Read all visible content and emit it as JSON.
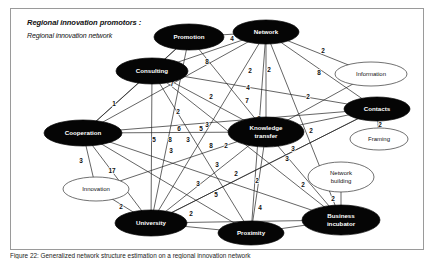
{
  "header": {
    "title": "Regional innovation promotors :",
    "subtitle": "Regional innovation network"
  },
  "caption": {
    "text": "Figure 22: Generalized network structure estimation on a regional innovation network"
  },
  "chart_data": {
    "type": "diagram",
    "subtype": "weighted-network-graph",
    "title": "Regional innovation promotors : Regional innovation network",
    "directed": false,
    "legend": {
      "dark_node": "core promotor (filled black ellipse)",
      "light_node": "peripheral actor (white outlined ellipse)",
      "edge_label": "tie strength / number of contacts"
    },
    "nodes": [
      {
        "id": "promotion",
        "label": "Promotion",
        "style": "dark",
        "cx": 178,
        "cy": 28,
        "rx": 35,
        "ry": 13
      },
      {
        "id": "network",
        "label": "Network",
        "style": "dark",
        "cx": 255,
        "cy": 23,
        "rx": 33,
        "ry": 12
      },
      {
        "id": "consulting",
        "label": "Consulting",
        "style": "dark",
        "cx": 141,
        "cy": 62,
        "rx": 36,
        "ry": 13
      },
      {
        "id": "information",
        "label": "Information",
        "style": "light",
        "cx": 360,
        "cy": 65,
        "rx": 36,
        "ry": 12
      },
      {
        "id": "contacts",
        "label": "Contacts",
        "style": "dark",
        "cx": 366,
        "cy": 100,
        "rx": 33,
        "ry": 12
      },
      {
        "id": "cooperation",
        "label": "Cooperation",
        "style": "dark",
        "cx": 72,
        "cy": 124,
        "rx": 39,
        "ry": 13
      },
      {
        "id": "knowledge_transfer",
        "label": "Knowledge transfer",
        "style": "dark",
        "cx": 255,
        "cy": 123,
        "rx": 38,
        "ry": 15
      },
      {
        "id": "framing",
        "label": "Framing",
        "style": "light",
        "cx": 368,
        "cy": 130,
        "rx": 29,
        "ry": 11
      },
      {
        "id": "network_building",
        "label": "Network building",
        "style": "light",
        "cx": 330,
        "cy": 168,
        "rx": 33,
        "ry": 15
      },
      {
        "id": "innovation",
        "label": "Innovation",
        "style": "light",
        "cx": 85,
        "cy": 180,
        "rx": 33,
        "ry": 12
      },
      {
        "id": "university",
        "label": "University",
        "style": "dark",
        "cx": 140,
        "cy": 214,
        "rx": 36,
        "ry": 13
      },
      {
        "id": "proximity",
        "label": "Proximity",
        "style": "dark",
        "cx": 240,
        "cy": 224,
        "rx": 33,
        "ry": 12
      },
      {
        "id": "business_incubator",
        "label": "Business incubator",
        "style": "dark",
        "cx": 330,
        "cy": 211,
        "rx": 39,
        "ry": 15
      }
    ],
    "edges": [
      {
        "source": "promotion",
        "target": "network",
        "weight": 4,
        "lx": 221,
        "ly": 30
      },
      {
        "source": "promotion",
        "target": "consulting",
        "weight": 8,
        "lx": 196,
        "ly": 53
      },
      {
        "source": "promotion",
        "target": "university",
        "weight": 3,
        "lx": 160,
        "ly": 142
      },
      {
        "source": "promotion",
        "target": "knowledge_transfer",
        "weight": 2,
        "lx": 200,
        "ly": 88
      },
      {
        "source": "network",
        "target": "information",
        "weight": 2,
        "lx": 312,
        "ly": 42
      },
      {
        "source": "network",
        "target": "contacts",
        "weight": 8,
        "lx": 308,
        "ly": 64
      },
      {
        "source": "network",
        "target": "consulting",
        "weight": 2,
        "lx": 239,
        "ly": 62
      },
      {
        "source": "network",
        "target": "knowledge_transfer",
        "weight": 9,
        "lx": 248,
        "ly": 110
      },
      {
        "source": "network",
        "target": "university",
        "weight": 4,
        "lx": 237,
        "ly": 79
      },
      {
        "source": "network",
        "target": "cooperation",
        "weight": 7,
        "lx": 236,
        "ly": 92
      },
      {
        "source": "network",
        "target": "business_incubator",
        "weight": 3,
        "lx": 276,
        "ly": 150
      },
      {
        "source": "network",
        "target": "proximity",
        "weight": 2,
        "lx": 246,
        "ly": 172
      },
      {
        "source": "consulting",
        "target": "cooperation",
        "weight": 1,
        "lx": 103,
        "ly": 95
      },
      {
        "source": "consulting",
        "target": "knowledge_transfer",
        "weight": 7,
        "lx": 161,
        "ly": 75
      },
      {
        "source": "consulting",
        "target": "university",
        "weight": 2,
        "lx": 167,
        "ly": 103
      },
      {
        "source": "consulting",
        "target": "contacts",
        "weight": 2,
        "lx": 258,
        "ly": 61
      },
      {
        "source": "consulting",
        "target": "business_incubator",
        "weight": 2,
        "lx": 215,
        "ly": 137
      },
      {
        "source": "information",
        "target": "knowledge_transfer",
        "weight": 2,
        "lx": 297,
        "ly": 88
      },
      {
        "source": "contacts",
        "target": "framing",
        "weight": 2,
        "lx": 369,
        "ly": 116
      },
      {
        "source": "contacts",
        "target": "knowledge_transfer",
        "weight": 2,
        "lx": 300,
        "ly": 122
      },
      {
        "source": "contacts",
        "target": "university",
        "weight": 3,
        "lx": 206,
        "ly": 156
      },
      {
        "source": "cooperation",
        "target": "innovation",
        "weight": 3,
        "lx": 70,
        "ly": 152
      },
      {
        "source": "cooperation",
        "target": "university",
        "weight": 17,
        "lx": 101,
        "ly": 162
      },
      {
        "source": "cooperation",
        "target": "knowledge_transfer",
        "weight": 6,
        "lx": 168,
        "ly": 120
      },
      {
        "source": "cooperation",
        "target": "contacts",
        "weight": 5,
        "lx": 190,
        "ly": 120
      },
      {
        "source": "cooperation",
        "target": "business_incubator",
        "weight": 5,
        "lx": 143,
        "ly": 131
      },
      {
        "source": "cooperation",
        "target": "proximity",
        "weight": 3,
        "lx": 177,
        "ly": 131
      },
      {
        "source": "cooperation",
        "target": "promotion",
        "weight": 8,
        "lx": 159,
        "ly": 131
      },
      {
        "source": "knowledge_transfer",
        "target": "university",
        "weight": 8,
        "lx": 200,
        "ly": 137
      },
      {
        "source": "knowledge_transfer",
        "target": "business_incubator",
        "weight": 3,
        "lx": 282,
        "ly": 140
      },
      {
        "source": "knowledge_transfer",
        "target": "proximity",
        "weight": 2,
        "lx": 225,
        "ly": 165
      },
      {
        "source": "knowledge_transfer",
        "target": "innovation",
        "weight": 3,
        "lx": 187,
        "ly": 175
      },
      {
        "source": "network_building",
        "target": "business_incubator",
        "weight": 2,
        "lx": 322,
        "ly": 190
      },
      {
        "source": "innovation",
        "target": "university",
        "weight": 2,
        "lx": 110,
        "ly": 198
      },
      {
        "source": "university",
        "target": "business_incubator",
        "weight": 2,
        "lx": 292,
        "ly": 176
      },
      {
        "source": "university",
        "target": "proximity",
        "weight": 2,
        "lx": 180,
        "ly": 205
      },
      {
        "source": "university",
        "target": "contacts",
        "weight": 5,
        "lx": 205,
        "ly": 186
      },
      {
        "source": "proximity",
        "target": "business_incubator",
        "weight": 4,
        "lx": 249,
        "ly": 199
      },
      {
        "source": "proximity",
        "target": "consulting",
        "weight": 3,
        "lx": 196,
        "ly": 116
      }
    ]
  }
}
